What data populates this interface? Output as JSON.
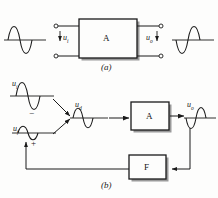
{
  "figure": {
    "background_color": "#fdfdfc",
    "line_color": "#1a1a1a",
    "shadow_color": "#9a9a9a"
  },
  "panel_a": {
    "caption": "(a)",
    "block_label": "A",
    "input_label": "u",
    "input_sub": "i",
    "output_label": "u",
    "output_sub": "o",
    "input_waveform": {
      "name": "input-sine",
      "phase": "positive-first",
      "amplitude": "large"
    },
    "output_waveform": {
      "name": "output-sine",
      "phase": "negative-first",
      "amplitude": "large"
    },
    "terminals": 4
  },
  "panel_b": {
    "caption": "(b)",
    "amplifier_label": "A",
    "feedback_label": "F",
    "signals": [
      {
        "label": "u",
        "sub": "i",
        "name": "input-signal",
        "amplitude": "large",
        "phase": "positive-first"
      },
      {
        "label": "u",
        "sub": "f",
        "name": "feedback-signal",
        "amplitude": "small",
        "phase": "positive-first"
      },
      {
        "label": "u",
        "sub": "d",
        "name": "difference-signal",
        "amplitude": "medium",
        "phase": "positive-first"
      },
      {
        "label": "u",
        "sub": "o",
        "name": "output-signal",
        "amplitude": "large",
        "phase": "negative-first"
      }
    ],
    "summing_sign_top": "−",
    "summing_sign_bottom": "+"
  }
}
